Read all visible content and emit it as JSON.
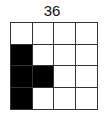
{
  "title": "36",
  "grid": {
    "rows": 4,
    "cols": 4,
    "cells": [
      [
        0,
        0,
        0,
        0
      ],
      [
        1,
        0,
        0,
        0
      ],
      [
        1,
        1,
        0,
        0
      ],
      [
        1,
        0,
        0,
        0
      ]
    ]
  },
  "colors": {
    "filled": "#000000",
    "empty": "#ffffff",
    "line": "#333333"
  }
}
